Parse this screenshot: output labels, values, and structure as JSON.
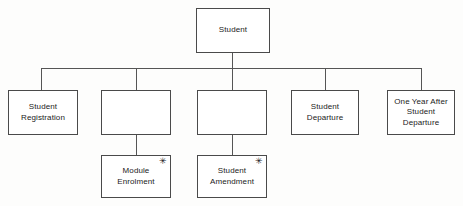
{
  "diagram": {
    "type": "tree",
    "background_color": "#fdfdfc",
    "line_color": "#555555",
    "box_border_color": "#4a4a4a",
    "box_fill_color": "#ffffff",
    "text_color": "#1b1b1b",
    "marker_glyph": "✳",
    "root": {
      "id": "student",
      "label": "Student"
    },
    "children": [
      {
        "id": "student-registration",
        "label": "Student\nRegistration",
        "marker": "",
        "blank": false
      },
      {
        "id": "blank-node-1",
        "label": "",
        "marker": "",
        "blank": true
      },
      {
        "id": "blank-node-2",
        "label": "",
        "marker": "",
        "blank": true
      },
      {
        "id": "student-departure",
        "label": "Student\nDeparture",
        "marker": "",
        "blank": false
      },
      {
        "id": "one-year-after-student-departure",
        "label": "One Year After\nStudent\nDeparture",
        "marker": "",
        "blank": false
      }
    ],
    "grandchildren": [
      {
        "id": "module-enrolment",
        "label": "Module\nEnrolment",
        "marker": "✳",
        "parent": "blank-node-1",
        "blank": false
      },
      {
        "id": "student-amendment",
        "label": "Student\nAmendment",
        "marker": "✳",
        "parent": "blank-node-2",
        "blank": false
      }
    ]
  }
}
